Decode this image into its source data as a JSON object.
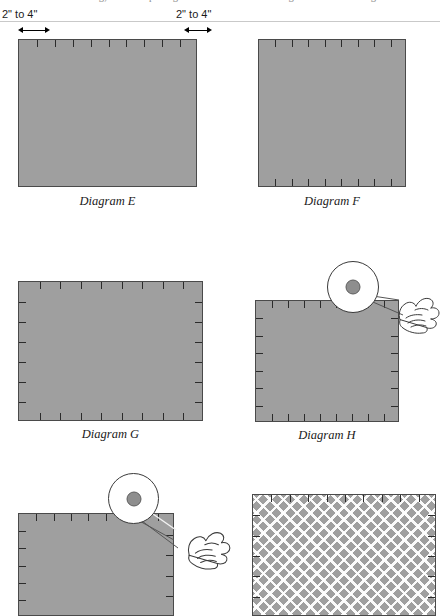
{
  "page": {
    "cut_off_header_text": "fastening, and the spacing of the fasteners at the edges of the sheathing"
  },
  "dimension_callouts": [
    {
      "label": "2\" to 4\"",
      "name": "dimension-label-left"
    },
    {
      "label": "2\" to 4\"",
      "name": "dimension-label-right"
    }
  ],
  "diagrams": [
    {
      "id": "E",
      "caption": "Diagram E",
      "fill_color": "#9f9f9f",
      "edge_color": "#4a4a4a",
      "ticks": {
        "top": 9,
        "bottom": 0,
        "left": 0,
        "right": 0
      },
      "hatched": false,
      "has_magnifier": false,
      "has_hand": false
    },
    {
      "id": "F",
      "caption": "Diagram F",
      "fill_color": "#9f9f9f",
      "edge_color": "#4a4a4a",
      "ticks": {
        "top": 8,
        "bottom": 8,
        "left": 0,
        "right": 0
      },
      "hatched": false,
      "has_magnifier": false,
      "has_hand": false
    },
    {
      "id": "G",
      "caption": "Diagram G",
      "fill_color": "#9f9f9f",
      "edge_color": "#4a4a4a",
      "ticks": {
        "top": 8,
        "bottom": 8,
        "left": 6,
        "right": 6
      },
      "hatched": false,
      "has_magnifier": false,
      "has_hand": false
    },
    {
      "id": "H",
      "caption": "Diagram H",
      "fill_color": "#9f9f9f",
      "edge_color": "#4a4a4a",
      "ticks": {
        "top": 8,
        "bottom": 8,
        "left": 6,
        "right": 6
      },
      "hatched": false,
      "has_magnifier": true,
      "has_hand": true
    },
    {
      "id": "I",
      "caption": "",
      "fill_color": "#9f9f9f",
      "edge_color": "#4a4a4a",
      "ticks": {
        "top": 8,
        "bottom": 0,
        "left": 5,
        "right": 4
      },
      "hatched": false,
      "has_magnifier": true,
      "has_hand": true
    },
    {
      "id": "J",
      "caption": "",
      "fill_color": "#9f9f9f",
      "edge_color": "#4a4a4a",
      "ticks": {
        "top": 9,
        "bottom": 0,
        "left": 5,
        "right": 5
      },
      "hatched": true,
      "has_magnifier": false,
      "has_hand": false
    }
  ],
  "magnifier": {
    "dot_color": "#8e8e8e",
    "dot_border_color": "#5e5e5e",
    "circle_border_color": "#3a3a3a",
    "semantic": "fastener-head-detail"
  },
  "colors": {
    "board_gray": "#9f9f9f",
    "outline": "#4a4a4a",
    "tick": "#2b2b2b",
    "rule": "#c9c9c9",
    "hatch": "#ffffff"
  }
}
